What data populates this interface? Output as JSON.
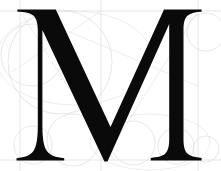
{
  "document": {
    "kind": "letterform-construction-diagram",
    "title": "M",
    "description": "Capital letter M letterform over geometric construction guides",
    "canvas": {
      "width": 221,
      "height": 171
    },
    "background_color": "#ffffff"
  },
  "glyph": {
    "character": "M",
    "name": "capital-m",
    "style": "didone-serif",
    "fill_color": "#0a0a0a",
    "cap_height_y": 11,
    "baseline_y": 160,
    "left_edge_x": 15,
    "right_edge_x": 210
  },
  "guides": {
    "stroke_color": "#dcdcdc",
    "faint_stroke_color": "#e6e6e6",
    "stroke_width": 0.7,
    "horizontal_rules": [
      {
        "name": "cap-height-line",
        "y": 11
      },
      {
        "name": "baseline",
        "y": 160
      }
    ],
    "vertical_rules": [
      {
        "name": "left-stem-guide",
        "x": 20
      },
      {
        "name": "center-guide",
        "x": 101
      },
      {
        "name": "right-stem-guide",
        "x": 198
      }
    ],
    "circles": [
      {
        "name": "upper-left-large-circle",
        "cx": 60,
        "cy": 62,
        "r": 52
      },
      {
        "name": "upper-left-small-circle",
        "cx": 32,
        "cy": 55,
        "r": 31
      },
      {
        "name": "upper-right-small-circle",
        "cx": 206,
        "cy": 32,
        "r": 19
      },
      {
        "name": "lower-left-small-circle",
        "cx": 33,
        "cy": 145,
        "r": 19
      },
      {
        "name": "lower-left-mid-circle",
        "cx": 73,
        "cy": 140,
        "r": 26
      },
      {
        "name": "lower-center-circle",
        "cx": 133,
        "cy": 143,
        "r": 22
      },
      {
        "name": "lower-right-small-circle",
        "cx": 176,
        "cy": 146,
        "r": 18
      },
      {
        "name": "lower-right-tiny-circle",
        "cx": 206,
        "cy": 149,
        "r": 13
      }
    ],
    "ellipses": [
      {
        "name": "upper-left-wide-ellipse",
        "cx": 74,
        "cy": 58,
        "rx": 78,
        "ry": 47
      },
      {
        "name": "lower-right-wide-ellipse",
        "cx": 150,
        "cy": 142,
        "rx": 60,
        "ry": 28
      }
    ],
    "diagonals": [
      {
        "name": "left-diagonal-guide",
        "x1": 20,
        "y1": 11,
        "x2": 114,
        "y2": 160
      },
      {
        "name": "right-diagonal-guide",
        "x1": 198,
        "y1": 11,
        "x2": 104,
        "y2": 160
      },
      {
        "name": "apex-diagonal-guide",
        "x1": 20,
        "y1": 11,
        "x2": 198,
        "y2": 86
      },
      {
        "name": "cross-diagonal-guide",
        "x1": 101,
        "y1": 11,
        "x2": 12,
        "y2": 72
      }
    ]
  },
  "labels": {
    "none": ""
  }
}
